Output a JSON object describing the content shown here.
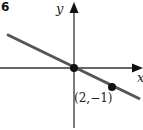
{
  "problem_number": "6",
  "axes": {
    "x_label": "x",
    "y_label": "y"
  },
  "line": {
    "description": "line through origin and (2,-1)",
    "slope": -0.5,
    "color": "#555555"
  },
  "points": [
    {
      "name": "origin",
      "x": 0,
      "y": 0
    },
    {
      "name": "P",
      "x": 2,
      "y": -1,
      "label": "(2,−1)"
    }
  ]
}
